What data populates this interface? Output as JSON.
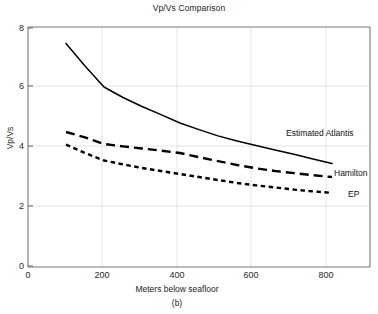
{
  "chart_data": {
    "type": "line",
    "title": "Vp/Vs Comparison",
    "xlabel": "Meters below seafloor",
    "ylabel": "Vp/Vs",
    "panel_label": "(b)",
    "xlim": [
      0,
      900
    ],
    "ylim": [
      0,
      8
    ],
    "xticks": [
      0,
      200,
      400,
      600,
      800
    ],
    "yticks": [
      0,
      2,
      4,
      6,
      8
    ],
    "xtick_labels": [
      "0",
      "200",
      "400",
      "600",
      "800"
    ],
    "ytick_labels": [
      "0",
      "2",
      "4",
      "6",
      "8"
    ],
    "grid": "light gray horizontal and vertical gridlines at major ticks",
    "legend_position": "inline labels at right end of each curve",
    "series": [
      {
        "name": "Estimated Atlantis",
        "style": "solid",
        "color": "#000000",
        "x": [
          100,
          150,
          200,
          250,
          300,
          350,
          400,
          450,
          500,
          550,
          600,
          650,
          700,
          750,
          800
        ],
        "values": [
          7.45,
          6.7,
          6.0,
          5.65,
          5.35,
          5.08,
          4.8,
          4.58,
          4.37,
          4.2,
          4.05,
          3.9,
          3.76,
          3.6,
          3.45
        ]
      },
      {
        "name": "Hamilton",
        "style": "dashed",
        "color": "#000000",
        "x": [
          100,
          150,
          200,
          250,
          300,
          350,
          400,
          450,
          500,
          550,
          600,
          650,
          700,
          750,
          800
        ],
        "values": [
          4.5,
          4.32,
          4.1,
          4.02,
          3.95,
          3.88,
          3.8,
          3.66,
          3.53,
          3.4,
          3.29,
          3.2,
          3.13,
          3.06,
          3.0
        ]
      },
      {
        "name": "EP",
        "style": "dotted",
        "color": "#000000",
        "x": [
          100,
          150,
          200,
          250,
          300,
          350,
          400,
          450,
          500,
          550,
          600,
          650,
          700,
          750,
          800
        ],
        "values": [
          4.08,
          3.8,
          3.55,
          3.42,
          3.3,
          3.2,
          3.1,
          3.0,
          2.9,
          2.8,
          2.72,
          2.65,
          2.58,
          2.52,
          2.47
        ]
      }
    ],
    "axis_color": "#6b6b6b",
    "grid_color": "#e0e0e0",
    "background": "#ffffff"
  },
  "labels": {
    "series_atlantis": "Estimated Atlantis",
    "series_hamilton": "Hamilton",
    "series_ep": "EP"
  }
}
